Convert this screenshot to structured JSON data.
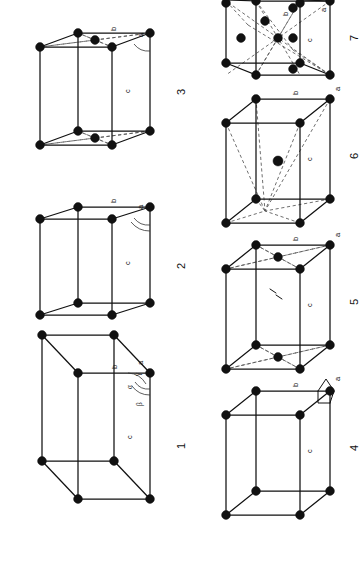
{
  "figure": {
    "orientation": "page rotated 90 degrees (landscape content on portrait sheet)",
    "axis_labels": {
      "a": "a",
      "b": "b",
      "c": "c"
    },
    "angle_labels": {
      "alpha": "α",
      "beta": "β",
      "gamma": "γ"
    },
    "colors": {
      "background": "#ffffff",
      "ink": "#111111",
      "hidden_edge": "#555555"
    }
  },
  "cells": [
    {
      "number": "1",
      "name": "triclinic-primitive",
      "vertex_count": 8,
      "centering": "primitive",
      "edge_labels": [
        "a",
        "b",
        "c"
      ],
      "angle_labels": [
        "α",
        "β",
        "γ"
      ],
      "has_dashed": false
    },
    {
      "number": "2",
      "name": "monoclinic-primitive",
      "vertex_count": 8,
      "centering": "primitive",
      "edge_labels": [
        "a",
        "b",
        "c"
      ],
      "angle_labels": [],
      "has_dashed": false
    },
    {
      "number": "3",
      "name": "monoclinic-base-centered",
      "vertex_count": 10,
      "centering": "base-centered",
      "edge_labels": [
        "a",
        "b",
        "c"
      ],
      "angle_labels": [],
      "has_dashed": true
    },
    {
      "number": "4",
      "name": "orthorhombic-primitive",
      "vertex_count": 8,
      "centering": "primitive",
      "edge_labels": [
        "a",
        "b",
        "c"
      ],
      "angle_labels": [],
      "has_dashed": false
    },
    {
      "number": "5",
      "name": "orthorhombic-base-centered",
      "vertex_count": 10,
      "centering": "base-centered",
      "edge_labels": [
        "a",
        "b",
        "c"
      ],
      "angle_labels": [],
      "has_dashed": true
    },
    {
      "number": "6",
      "name": "orthorhombic-body-centered",
      "vertex_count": 9,
      "centering": "body-centered",
      "edge_labels": [
        "a",
        "b",
        "c"
      ],
      "angle_labels": [],
      "has_dashed": true
    },
    {
      "number": "7",
      "name": "orthorhombic-face-centered",
      "vertex_count": 14,
      "centering": "face-centered",
      "edge_labels": [
        "a",
        "b",
        "c"
      ],
      "angle_labels": [],
      "has_dashed": true
    }
  ]
}
